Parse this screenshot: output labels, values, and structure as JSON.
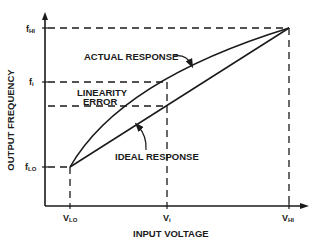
{
  "diagram": {
    "x_axis_label": "INPUT VOLTAGE",
    "y_axis_label": "OUTPUT FREQUENCY",
    "y_ticks": {
      "f_hi": {
        "base": "f",
        "sub": "HI"
      },
      "f_i": {
        "base": "f",
        "sub": "i"
      },
      "f_lo": {
        "base": "f",
        "sub": "LO"
      }
    },
    "x_ticks": {
      "v_lo": {
        "base": "V",
        "sub": "LO"
      },
      "v_i": {
        "base": "V",
        "sub": "i"
      },
      "v_hi": {
        "base": "V",
        "sub": "HI"
      }
    },
    "annotations": {
      "actual_response": "ACTUAL RESPONSE",
      "ideal_response": "IDEAL RESPONSE",
      "linearity_error_line1": "LINEARITY",
      "linearity_error_line2": "ERROR"
    },
    "colors": {
      "ink": "#1a1a1a",
      "background": "#ffffff"
    }
  }
}
